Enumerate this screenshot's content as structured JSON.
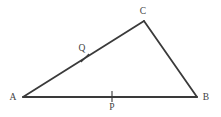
{
  "figure": {
    "type": "geometry-diagram",
    "shape": "triangle",
    "title": "",
    "canvas": {
      "width": 221,
      "height": 117,
      "background": "#ffffff"
    },
    "style": {
      "line_color": "#3a3a3a",
      "line_width": 1.8,
      "tick_color": "#3a3a3a",
      "tick_width": 1.1,
      "label_color": "#3f3f3f",
      "label_font_size": 9.5
    },
    "vertices": [
      {
        "id": "A",
        "label": "A",
        "x": 23,
        "y": 97,
        "label_x": 13,
        "label_y": 100
      },
      {
        "id": "B",
        "label": "B",
        "x": 197,
        "y": 97,
        "label_x": 206,
        "label_y": 100
      },
      {
        "id": "C",
        "label": "C",
        "x": 144,
        "y": 21,
        "label_x": 143,
        "label_y": 14
      }
    ],
    "edges": [
      {
        "id": "AB",
        "from": "A",
        "to": "B",
        "x1": 23,
        "y1": 97,
        "x2": 197,
        "y2": 97
      },
      {
        "id": "AC",
        "from": "A",
        "to": "C",
        "x1": 23,
        "y1": 97,
        "x2": 144,
        "y2": 21
      },
      {
        "id": "CB",
        "from": "C",
        "to": "B",
        "x1": 144,
        "y1": 21,
        "x2": 197,
        "y2": 97
      }
    ],
    "marked_points": [
      {
        "id": "P",
        "label": "P",
        "on_edge": "AB",
        "x": 112,
        "y": 97,
        "label_x": 112,
        "label_y": 110,
        "tick": {
          "x1": 112,
          "y1": 91,
          "x2": 112,
          "y2": 102
        }
      },
      {
        "id": "Q",
        "label": "Q",
        "on_edge": "AC",
        "x": 85,
        "y": 58,
        "label_x": 82,
        "label_y": 51,
        "tick": {
          "x1": 81,
          "y1": 62,
          "x2": 89,
          "y2": 54
        }
      }
    ]
  }
}
